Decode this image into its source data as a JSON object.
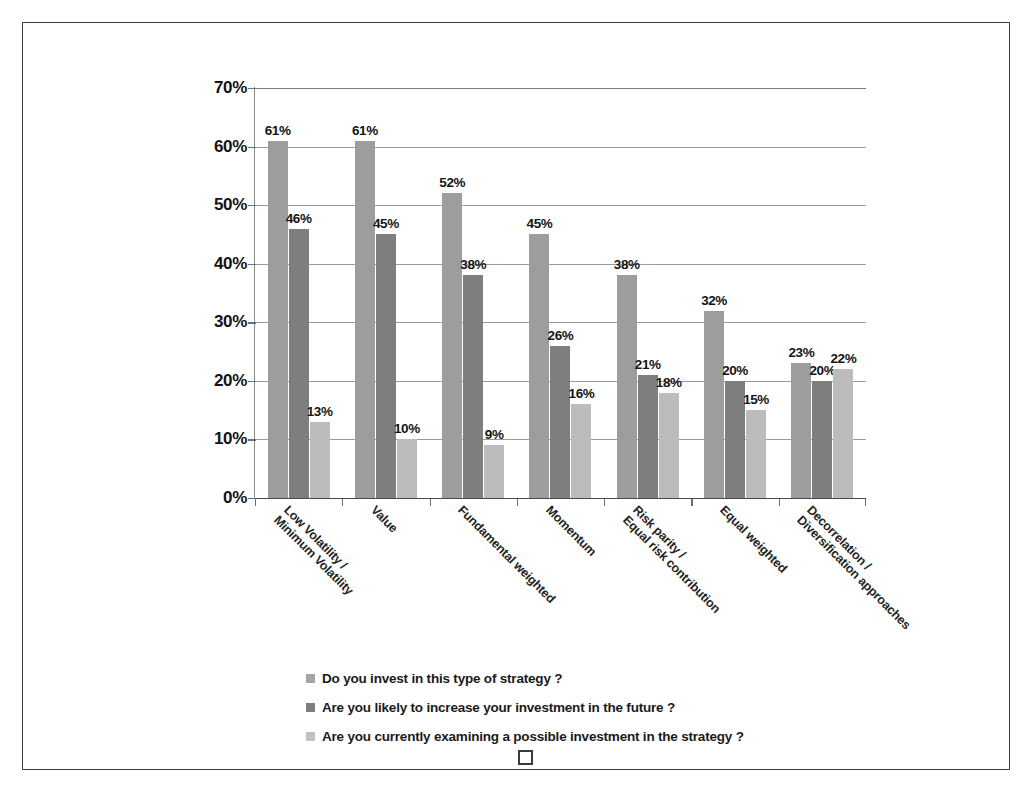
{
  "chart_data": {
    "type": "bar",
    "title": "",
    "xlabel": "",
    "ylabel": "",
    "ylim": [
      0,
      70
    ],
    "ytick_labels": [
      "0%",
      "10%",
      "20%",
      "30%",
      "40%",
      "50%",
      "60%",
      "70%"
    ],
    "ytick_values": [
      0,
      10,
      20,
      30,
      40,
      50,
      60,
      70
    ],
    "grid": true,
    "legend_position": "bottom-left",
    "value_suffix": "%",
    "categories": [
      "Low Volatility / Minimum Volatility",
      "Value",
      "Fundamental weighted",
      "Momentum",
      "Risk parity / Equal risk contribution",
      "Equal weighted",
      "Decorrelation / Diversification approaches"
    ],
    "category_lines": [
      [
        "Low Volatility /",
        "Minimum Volatility"
      ],
      [
        "Value",
        ""
      ],
      [
        "Fundamental weighted",
        ""
      ],
      [
        "Momentum",
        ""
      ],
      [
        "Risk parity /",
        "Equal risk contribution"
      ],
      [
        "Equal weighted",
        ""
      ],
      [
        "Decorrelation /",
        "Diversification approaches"
      ]
    ],
    "series": [
      {
        "name": "Do you invest in this type of strategy ?",
        "color": "#9d9d9d",
        "values": [
          61,
          61,
          52,
          45,
          38,
          32,
          23
        ],
        "labels": [
          "61%",
          "61%",
          "52%",
          "45%",
          "38%",
          "32%",
          "23%"
        ]
      },
      {
        "name": "Are you likely to increase your investment in the future ?",
        "color": "#7e7e7e",
        "values": [
          46,
          45,
          38,
          26,
          21,
          20,
          20
        ],
        "labels": [
          "46%",
          "45%",
          "38%",
          "26%",
          "21%",
          "20%",
          "20%"
        ]
      },
      {
        "name": "Are you  currently examining a possible investment in the strategy ?",
        "color": "#bcbcbc",
        "values": [
          13,
          10,
          9,
          16,
          18,
          15,
          22
        ],
        "labels": [
          "13%",
          "10%",
          "9%",
          "16%",
          "18%",
          "15%",
          "22%"
        ]
      }
    ]
  },
  "legend": {
    "items": [
      {
        "label": "Do you invest in this type of strategy ?",
        "swatch": "#a4a4a4"
      },
      {
        "label": "Are you likely to increase your investment in the future ?",
        "swatch": "#7e7e7e"
      },
      {
        "label": "Are you  currently examining a possible investment in the strategy ?",
        "swatch": "#c2c2c2"
      }
    ]
  }
}
